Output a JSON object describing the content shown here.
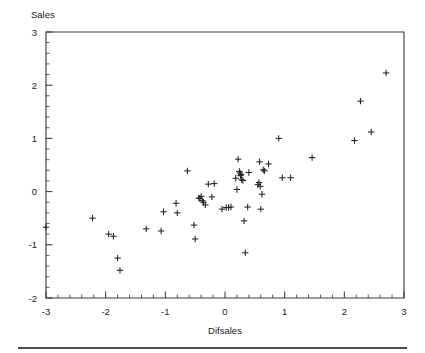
{
  "chart_data": {
    "type": "scatter",
    "title": "",
    "xlabel": "Difsales",
    "ylabel": "Sales",
    "xlim": [
      -3,
      3
    ],
    "ylim": [
      -2,
      3
    ],
    "grid": false,
    "legend": null,
    "marker": "plus",
    "marker_color": "#222222",
    "x_ticks": [
      -3,
      -2,
      -1,
      0,
      1,
      2,
      3
    ],
    "x_tick_labels": [
      "-3",
      "-2",
      "-1",
      "0",
      "1",
      "2",
      "3"
    ],
    "y_ticks": [
      -2,
      -1,
      0,
      1,
      2,
      3
    ],
    "y_tick_labels": [
      "-2",
      "-1",
      "0",
      "1",
      "2",
      "3"
    ],
    "x_minor_tick_step": 0.2,
    "y_minor_tick_step": 0.2,
    "n_points": 57,
    "points": [
      [
        -3.0,
        -0.67
      ],
      [
        -2.22,
        -0.5
      ],
      [
        -1.95,
        -0.8
      ],
      [
        -1.87,
        -0.84
      ],
      [
        -1.8,
        -1.25
      ],
      [
        -1.76,
        -1.48
      ],
      [
        -1.32,
        -0.7
      ],
      [
        -1.07,
        -0.74
      ],
      [
        -1.03,
        -0.38
      ],
      [
        -0.82,
        -0.22
      ],
      [
        -0.8,
        -0.4
      ],
      [
        -0.63,
        0.39
      ],
      [
        -0.52,
        -0.63
      ],
      [
        -0.5,
        -0.89
      ],
      [
        -0.42,
        -0.13
      ],
      [
        -0.4,
        -0.09
      ],
      [
        -0.38,
        -0.17
      ],
      [
        -0.36,
        -0.2
      ],
      [
        -0.33,
        -0.25
      ],
      [
        -0.28,
        0.14
      ],
      [
        -0.22,
        -0.1
      ],
      [
        -0.18,
        0.15
      ],
      [
        -0.05,
        -0.33
      ],
      [
        0.02,
        -0.3
      ],
      [
        0.06,
        -0.3
      ],
      [
        0.1,
        -0.29
      ],
      [
        0.18,
        0.25
      ],
      [
        0.2,
        0.04
      ],
      [
        0.22,
        0.61
      ],
      [
        0.25,
        0.35
      ],
      [
        0.26,
        0.3
      ],
      [
        0.27,
        0.32
      ],
      [
        0.3,
        0.21
      ],
      [
        0.32,
        -0.55
      ],
      [
        0.34,
        -1.15
      ],
      [
        0.38,
        -0.29
      ],
      [
        0.4,
        0.36
      ],
      [
        0.55,
        0.13
      ],
      [
        0.57,
        0.17
      ],
      [
        0.58,
        0.56
      ],
      [
        0.59,
        0.1
      ],
      [
        0.6,
        -0.33
      ],
      [
        0.62,
        -0.05
      ],
      [
        0.66,
        0.39
      ],
      [
        0.73,
        0.52
      ],
      [
        0.9,
        1.0
      ],
      [
        0.96,
        0.26
      ],
      [
        1.1,
        0.26
      ],
      [
        1.46,
        0.64
      ],
      [
        2.17,
        0.96
      ],
      [
        2.27,
        1.7
      ],
      [
        2.45,
        1.12
      ],
      [
        2.7,
        2.23
      ],
      [
        -0.44,
        -0.12
      ],
      [
        0.24,
        0.38
      ],
      [
        0.28,
        0.22
      ],
      [
        0.64,
        0.41
      ]
    ]
  },
  "figure": {
    "bottom_rule": true
  }
}
